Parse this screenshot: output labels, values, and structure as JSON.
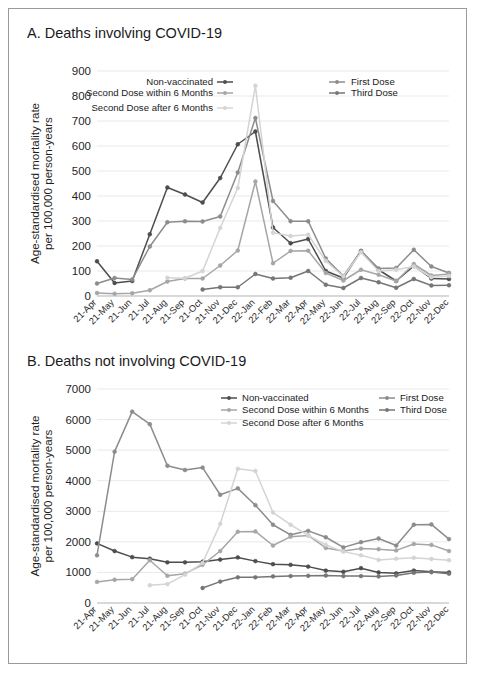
{
  "figure": {
    "background_color": "#ffffff",
    "border_color": "#9a9a9a"
  },
  "series_styles": {
    "Non-vaccinated": "#4d4d4d",
    "First Dose": "#8c8c8c",
    "Second Dose within 6 Months": "#a6a6a6",
    "Third Dose": "#767676",
    "Second Dose after 6 Months": "#d4d4d4"
  },
  "panel_a": {
    "title": "A. Deaths involving COVID-19",
    "ylabel_line1": "Age-standardised mortality rate",
    "ylabel_line2": "per 100,000 person-years",
    "legend": [
      {
        "label": "Non-vaccinated",
        "color": "#4d4d4d"
      },
      {
        "label": "First Dose",
        "color": "#8c8c8c"
      },
      {
        "label": "Second Dose within 6 Months",
        "color": "#a6a6a6"
      },
      {
        "label": "Third Dose",
        "color": "#767676"
      },
      {
        "label": "Second Dose after 6 Months",
        "color": "#d4d4d4"
      }
    ]
  },
  "panel_b": {
    "title": "B. Deaths not involving COVID-19",
    "ylabel_line1": "Age-standardised mortality rate",
    "ylabel_line2": "per 100,000 person-years",
    "legend": [
      {
        "label": "Non-vaccinated",
        "color": "#4d4d4d"
      },
      {
        "label": "First Dose",
        "color": "#8c8c8c"
      },
      {
        "label": "Second Dose within 6 Months",
        "color": "#a6a6a6"
      },
      {
        "label": "Third Dose",
        "color": "#767676"
      },
      {
        "label": "Second Dose after 6 Months",
        "color": "#d4d4d4"
      }
    ]
  },
  "chart_data": [
    {
      "type": "line",
      "id": "panel-a",
      "title": "A. Deaths involving COVID-19",
      "xlabel": "",
      "ylabel": "Age-standardised mortality rate per 100,000 person-years",
      "ylim": [
        0,
        900
      ],
      "yticks": [
        0,
        100,
        200,
        300,
        400,
        500,
        600,
        700,
        800,
        900
      ],
      "grid": true,
      "legend_position": "top",
      "categories": [
        "21-Apr",
        "21-May",
        "21-Jun",
        "21-Jul",
        "21-Aug",
        "21-Sep",
        "21-Oct",
        "21-Nov",
        "21-Dec",
        "22-Jan",
        "22-Feb",
        "22-Mar",
        "22-Apr",
        "22-May",
        "22-Jun",
        "22-Jul",
        "22-Aug",
        "22-Sep",
        "22-Oct",
        "22-Nov",
        "22-Dec"
      ],
      "series": [
        {
          "name": "Non-vaccinated",
          "color": "#4d4d4d",
          "values": [
            139,
            52,
            60,
            247,
            434,
            406,
            374,
            472,
            607,
            658,
            274,
            211,
            228,
            100,
            72,
            180,
            105,
            60,
            120,
            70,
            68
          ]
        },
        {
          "name": "First Dose",
          "color": "#8c8c8c",
          "values": [
            50,
            72,
            66,
            198,
            295,
            299,
            298,
            318,
            494,
            712,
            380,
            299,
            299,
            150,
            80,
            180,
            110,
            112,
            185,
            118,
            92
          ]
        },
        {
          "name": "Second Dose within 6 Months",
          "color": "#a6a6a6",
          "values": [
            12,
            9,
            11,
            23,
            58,
            70,
            70,
            122,
            182,
            458,
            131,
            180,
            181,
            92,
            62,
            105,
            85,
            60,
            128,
            82,
            88
          ]
        },
        {
          "name": "Third Dose",
          "color": "#767676",
          "values": [
            null,
            null,
            null,
            null,
            null,
            null,
            26,
            35,
            35,
            88,
            70,
            73,
            100,
            45,
            32,
            72,
            55,
            33,
            68,
            42,
            43
          ]
        },
        {
          "name": "Second Dose after 6 Months",
          "color": "#d4d4d4",
          "values": [
            null,
            null,
            null,
            null,
            73,
            71,
            100,
            272,
            432,
            841,
            253,
            240,
            245,
            140,
            78,
            175,
            100,
            105,
            118,
            75,
            80
          ]
        }
      ]
    },
    {
      "type": "line",
      "id": "panel-b",
      "title": "B. Deaths not involving COVID-19",
      "xlabel": "",
      "ylabel": "Age-standardised mortality rate per 100,000 person-years",
      "ylim": [
        0,
        7000
      ],
      "yticks": [
        0,
        1000,
        2000,
        3000,
        4000,
        5000,
        6000,
        7000
      ],
      "grid": true,
      "legend_position": "top",
      "categories": [
        "21-Apr",
        "21-May",
        "21-Jun",
        "21-Jul",
        "21-Aug",
        "21-Sep",
        "21-Oct",
        "21-Nov",
        "21-Dec",
        "22-Jan",
        "22-Feb",
        "22-Mar",
        "22-Apr",
        "22-May",
        "22-Jun",
        "22-Jul",
        "22-Aug",
        "22-Sep",
        "22-Oct",
        "22-Nov",
        "22-Dec"
      ],
      "series": [
        {
          "name": "Non-vaccinated",
          "color": "#4d4d4d",
          "values": [
            1950,
            1700,
            1500,
            1450,
            1330,
            1330,
            1350,
            1420,
            1490,
            1370,
            1270,
            1250,
            1190,
            1060,
            1020,
            1140,
            1000,
            970,
            1060,
            1020,
            1000
          ]
        },
        {
          "name": "First Dose",
          "color": "#8c8c8c",
          "values": [
            1560,
            4950,
            6260,
            5850,
            4490,
            4350,
            4430,
            3540,
            3750,
            3200,
            2560,
            2230,
            2360,
            2150,
            1820,
            1990,
            2110,
            1880,
            2560,
            2570,
            2090
          ]
        },
        {
          "name": "Second Dose within 6 Months",
          "color": "#a6a6a6",
          "values": [
            690,
            760,
            780,
            1400,
            890,
            960,
            1250,
            1700,
            2330,
            2340,
            1880,
            2170,
            2210,
            1800,
            1700,
            1780,
            1760,
            1720,
            1930,
            1900,
            1700
          ]
        },
        {
          "name": "Third Dose",
          "color": "#767676",
          "values": [
            null,
            null,
            null,
            null,
            null,
            null,
            490,
            700,
            840,
            840,
            870,
            880,
            890,
            900,
            880,
            880,
            870,
            900,
            990,
            1010,
            960
          ]
        },
        {
          "name": "Second Dose after 6 Months",
          "color": "#d4d4d4",
          "values": [
            null,
            null,
            null,
            580,
            620,
            930,
            1310,
            2590,
            4390,
            4320,
            2960,
            2560,
            2210,
            1900,
            1680,
            1560,
            1410,
            1450,
            1480,
            1440,
            1400
          ]
        }
      ]
    }
  ]
}
